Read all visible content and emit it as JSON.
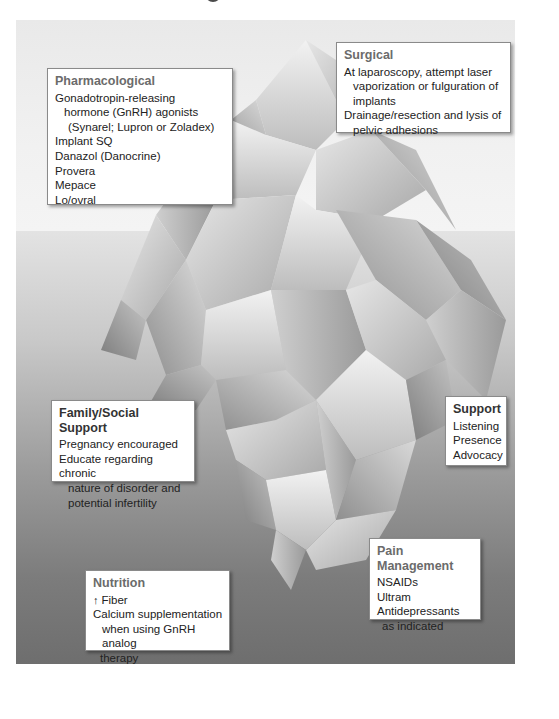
{
  "figure": {
    "title_fragment": "g",
    "colors": {
      "sky": "#f0f0f0",
      "water_top": "#e3e3e3",
      "water_bottom": "#6e6e6e",
      "box_background": "#ffffff",
      "box_border": "#8a8a8a",
      "title_gray": "#6b6b6b"
    },
    "waterline_y": 231
  },
  "boxes": {
    "pharmacological": {
      "title": "Pharmacological",
      "items": [
        {
          "line1": "Gonadotropin-releasing",
          "line2": "hormone (GnRH) agonists",
          "line3": "(Synarel; Lupron or Zoladex)"
        },
        {
          "line1": "Implant SQ"
        },
        {
          "line1": "Danazol (Danocrine)"
        },
        {
          "line1": "Provera"
        },
        {
          "line1": "Mepace"
        },
        {
          "line1": "Lo/ovral"
        }
      ]
    },
    "surgical": {
      "title": "Surgical",
      "items": [
        {
          "line1": "At laparoscopy, attempt laser",
          "line2": "vaporization or fulguration of",
          "line3": "implants"
        },
        {
          "line1": "Drainage/resection and lysis of",
          "line2": "pelvic adhesions"
        }
      ]
    },
    "family_social_support": {
      "title": "Family/Social Support",
      "items": [
        {
          "line1": "Pregnancy encouraged"
        },
        {
          "line1": "Educate regarding chronic",
          "line2": "nature of disorder and",
          "line3": "potential infertility"
        }
      ]
    },
    "support": {
      "title": "Support",
      "items": [
        {
          "line1": "Listening"
        },
        {
          "line1": "Presence"
        },
        {
          "line1": "Advocacy"
        }
      ]
    },
    "pain_management": {
      "title": "Pain Management",
      "items": [
        {
          "line1": "NSAIDs"
        },
        {
          "line1": "Ultram"
        },
        {
          "line1": "Antidepressants",
          "line2": "as indicated"
        }
      ]
    },
    "nutrition": {
      "title": "Nutrition",
      "items": [
        {
          "icon": "up-arrow-icon",
          "icon_glyph": "↑",
          "line1": "Fiber"
        },
        {
          "line1": "Calcium supplementation",
          "line2": "when using GnRH analog",
          "line3": "therapy"
        }
      ]
    }
  }
}
